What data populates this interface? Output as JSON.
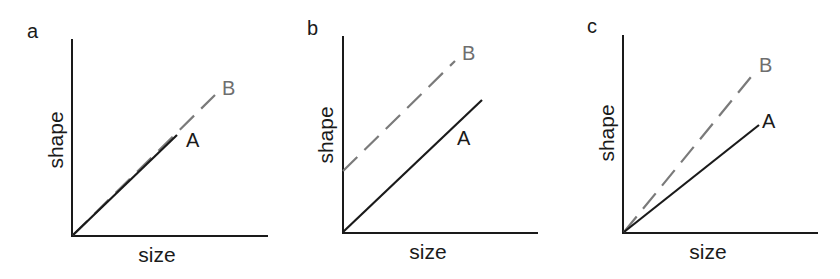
{
  "figure": {
    "panels": [
      {
        "letter": "a",
        "xlabel": "size",
        "ylabel": "shape",
        "line_a_label": "A",
        "line_b_label": "B",
        "description": "Lines A and B overlap, same intercept and slope; B extends further"
      },
      {
        "letter": "b",
        "xlabel": "size",
        "ylabel": "shape",
        "line_a_label": "A",
        "line_b_label": "B",
        "description": "Parallel lines; B has higher intercept than A"
      },
      {
        "letter": "c",
        "xlabel": "size",
        "ylabel": "shape",
        "line_a_label": "A",
        "line_b_label": "B",
        "description": "Same intercept at origin; B has steeper slope than A"
      }
    ],
    "colors": {
      "axis": "#1a1a1a",
      "line_a": "#1a1a1a",
      "line_b": "#7a7a7a",
      "label_b": "#6e6e6e"
    },
    "legend": {
      "A": "solid black line",
      "B": "dashed gray line"
    }
  }
}
